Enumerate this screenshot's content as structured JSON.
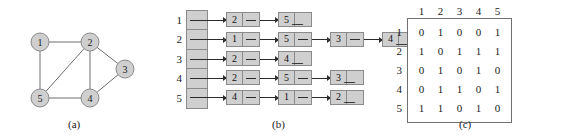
{
  "figure": {
    "captions": {
      "a": "(a)",
      "b": "(b)",
      "c": "(c)"
    }
  },
  "graph": {
    "nodes": [
      {
        "id": "1",
        "label": "1",
        "cx": 40,
        "cy": 42
      },
      {
        "id": "2",
        "label": "2",
        "cx": 90,
        "cy": 42
      },
      {
        "id": "3",
        "label": "3",
        "cx": 125,
        "cy": 69
      },
      {
        "id": "4",
        "label": "4",
        "cx": 90,
        "cy": 98
      },
      {
        "id": "5",
        "label": "5",
        "cx": 40,
        "cy": 98
      }
    ],
    "edges": [
      {
        "from": "1",
        "to": "2"
      },
      {
        "from": "1",
        "to": "5"
      },
      {
        "from": "2",
        "to": "5"
      },
      {
        "from": "2",
        "to": "3"
      },
      {
        "from": "2",
        "to": "4"
      },
      {
        "from": "3",
        "to": "4"
      },
      {
        "from": "4",
        "to": "5"
      }
    ],
    "node_fill": "#cfcfcf",
    "node_stroke": "#8a8a8a",
    "edge_color": "#6e6e6e"
  },
  "adjacency_lists": {
    "row_labels": [
      "1",
      "2",
      "3",
      "4",
      "5"
    ],
    "lists": [
      {
        "head": "1",
        "nodes": [
          "2",
          "5"
        ]
      },
      {
        "head": "2",
        "nodes": [
          "1",
          "5",
          "3",
          "4"
        ]
      },
      {
        "head": "3",
        "nodes": [
          "2",
          "4"
        ]
      },
      {
        "head": "4",
        "nodes": [
          "2",
          "5",
          "3"
        ]
      },
      {
        "head": "5",
        "nodes": [
          "4",
          "1",
          "2"
        ]
      }
    ]
  },
  "chart_data": {
    "type": "table",
    "col_headers": [
      "1",
      "2",
      "3",
      "4",
      "5"
    ],
    "row_headers": [
      "1",
      "2",
      "3",
      "4",
      "5"
    ],
    "rows": [
      [
        "0",
        "1",
        "0",
        "0",
        "1"
      ],
      [
        "1",
        "0",
        "1",
        "1",
        "1"
      ],
      [
        "0",
        "1",
        "0",
        "1",
        "0"
      ],
      [
        "0",
        "1",
        "1",
        "0",
        "1"
      ],
      [
        "1",
        "1",
        "0",
        "1",
        "0"
      ]
    ]
  }
}
